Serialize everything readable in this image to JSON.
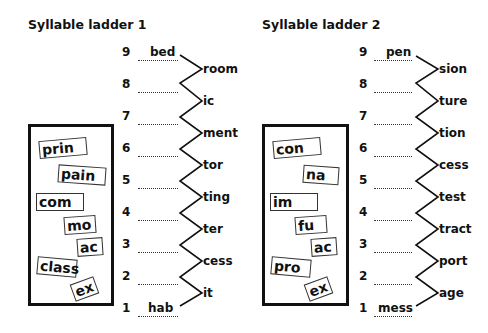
{
  "ladders": [
    {
      "title": "Syllable ladder 1",
      "rows": [
        {
          "num": "9",
          "given": "bed"
        },
        {
          "num": "8",
          "given": ""
        },
        {
          "num": "7",
          "given": ""
        },
        {
          "num": "6",
          "given": ""
        },
        {
          "num": "5",
          "given": ""
        },
        {
          "num": "4",
          "given": ""
        },
        {
          "num": "3",
          "given": ""
        },
        {
          "num": "2",
          "given": ""
        },
        {
          "num": "1",
          "given": "hab"
        }
      ],
      "suffixes": [
        "room",
        "ic",
        "ment",
        "tor",
        "ting",
        "ter",
        "cess",
        "it"
      ],
      "tiles": [
        "prin",
        "pain",
        "com",
        "mo",
        "ac",
        "class",
        "ex"
      ]
    },
    {
      "title": "Syllable ladder 2",
      "rows": [
        {
          "num": "9",
          "given": "pen"
        },
        {
          "num": "8",
          "given": ""
        },
        {
          "num": "7",
          "given": ""
        },
        {
          "num": "6",
          "given": ""
        },
        {
          "num": "5",
          "given": ""
        },
        {
          "num": "4",
          "given": ""
        },
        {
          "num": "3",
          "given": ""
        },
        {
          "num": "2",
          "given": ""
        },
        {
          "num": "1",
          "given": "mess"
        }
      ],
      "suffixes": [
        "sion",
        "ture",
        "tion",
        "cess",
        "test",
        "tract",
        "port",
        "age"
      ],
      "tiles": [
        "con",
        "na",
        "im",
        "fu",
        "ac",
        "pro",
        "ex"
      ]
    }
  ]
}
